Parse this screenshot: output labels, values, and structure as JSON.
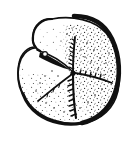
{
  "figure": {
    "kind": "line-drawing-illustration",
    "style": "stipple engraving, black ink on white",
    "title": "",
    "caption": "",
    "label": "",
    "frame": {
      "visible": true,
      "color": "#a7a7a7",
      "thickness_px": 1,
      "x": 12,
      "y": 13,
      "width": 113,
      "height": 118
    },
    "background_color": "#ffffff",
    "ink_color": "#101010",
    "page_background": "#ffffff",
    "features": [
      {
        "name": "upper-left-lobe",
        "description": "raised rounded lobe at upper left"
      },
      {
        "name": "upper-right-lobe",
        "description": "large rounded lobe occupying upper right, heavily stippled"
      },
      {
        "name": "lower-lobe",
        "description": "broad lower lobe with dense stipple and dark lower rim"
      },
      {
        "name": "central-node",
        "description": "small dark node where sutures converge"
      },
      {
        "name": "suture-up",
        "description": "serrated suture running upward from centre"
      },
      {
        "name": "suture-down",
        "description": "serrated suture running downward from centre to lower rim"
      },
      {
        "name": "suture-right",
        "description": "serrated suture running right from centre"
      },
      {
        "name": "suture-lower-left",
        "description": "plain suture running to lower left"
      },
      {
        "name": "groove-upper-left",
        "description": "wedge-shaped dark groove from centre toward upper-left lobe"
      },
      {
        "name": "outline-right-heavy",
        "description": "thick black outline along right and lower-right margin"
      },
      {
        "name": "outline-left-light",
        "description": "thin outline along left margin"
      }
    ]
  }
}
